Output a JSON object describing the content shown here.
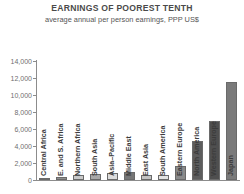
{
  "chart_data": {
    "type": "bar",
    "title": "EARNINGS OF POOREST TENTH",
    "subtitle": "average annual per person earnings, PPP US$",
    "xlabel": "",
    "ylabel": "",
    "ylim": [
      0,
      14000
    ],
    "grid": false,
    "legend": "none",
    "ytick_labels": [
      "14,000",
      "12,000",
      "10,000",
      "8,000",
      "6,000",
      "4,000",
      "2,000",
      "0"
    ],
    "ytick_values": [
      14000,
      12000,
      10000,
      8000,
      6000,
      4000,
      2000,
      0
    ],
    "categories": [
      "Central Africa",
      "E. and S. Africa",
      "Northern Africa",
      "South Asia",
      "Asia–Pacific",
      "Middle East",
      "East Asia",
      "South America",
      "Eastern Europe",
      "North America",
      "Western Europe",
      "Japan"
    ],
    "values": [
      260,
      300,
      640,
      700,
      820,
      1000,
      560,
      620,
      1650,
      4600,
      6900,
      11500
    ],
    "bar_colors": [
      "#6f6f6f",
      "#8f8f8f",
      "#c9c9c9",
      "#a8a8a8",
      "#dcdcdc",
      "#767676",
      "#c2c2c2",
      "#e3e3e3",
      "#8a8a8a",
      "#5d5d5d",
      "#4f4f4f",
      "#7a7a7a"
    ]
  }
}
